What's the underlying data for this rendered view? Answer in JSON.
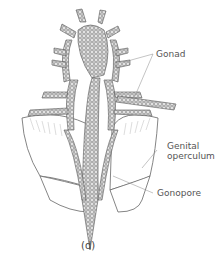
{
  "figure": {
    "panel_label": "(d)",
    "labels": [
      {
        "id": "gonad",
        "text": "Gonad"
      },
      {
        "id": "genital_line1",
        "text": "Genital"
      },
      {
        "id": "genital_line2",
        "text": "operculum"
      },
      {
        "id": "gonopore",
        "text": "Gonopore"
      }
    ],
    "colors": {
      "stroke": "#555555",
      "tissue": "#8a8a8a",
      "label": "#555555"
    }
  }
}
